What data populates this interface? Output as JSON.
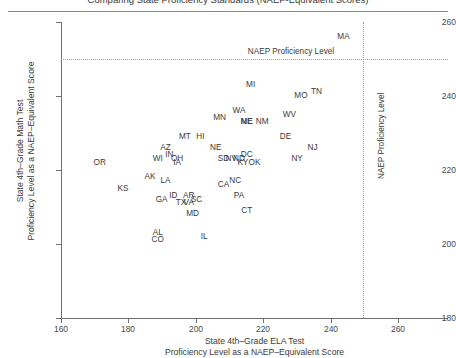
{
  "figure": {
    "title_clipped": "Comparing State Proficiency Standards (NAEP-Equivalent Scores)"
  },
  "chart_data": {
    "type": "scatter",
    "title": "Comparing State Proficiency Standards (NAEP-Equivalent Scores)",
    "xlabel_line1": "State 4th–Grade ELA Test",
    "xlabel_line2": "Proficiency Level as a NAEP–Equivalent Score",
    "ylabel_line1": "State 4th–Grade Math Test",
    "ylabel_line2": "Proficiency Level as a NAEP–Equivalent Score",
    "xlim": [
      160,
      260
    ],
    "ylim": [
      180,
      260
    ],
    "xticks": [
      160,
      180,
      200,
      220,
      240,
      260
    ],
    "yticks": [
      180,
      200,
      220,
      240,
      260
    ],
    "grid": false,
    "legend": null,
    "annotations": [
      {
        "name": "naep-proficiency-horizontal",
        "type": "hline",
        "value": 250,
        "label": "NAEP Proficiency Level",
        "style": "dotted"
      },
      {
        "name": "naep-proficiency-vertical",
        "type": "vline",
        "value": 238,
        "label": "NAEP Proficiency Level",
        "style": "dotted"
      }
    ],
    "point_label_format": "state-abbreviation",
    "points": [
      {
        "label": "MA",
        "x": 233,
        "y": 256
      },
      {
        "label": "MI",
        "x": 209,
        "y": 243
      },
      {
        "label": "TN",
        "x": 226,
        "y": 241
      },
      {
        "label": "MO",
        "x": 222,
        "y": 240
      },
      {
        "label": "WA",
        "x": 206,
        "y": 236
      },
      {
        "label": "WV",
        "x": 219,
        "y": 235
      },
      {
        "label": "MN",
        "x": 201,
        "y": 234
      },
      {
        "label": "ME",
        "x": 208,
        "y": 233
      },
      {
        "label": "NE",
        "x": 208,
        "y": 233
      },
      {
        "label": "NM",
        "x": 212,
        "y": 233
      },
      {
        "label": "HI",
        "x": 196,
        "y": 229
      },
      {
        "label": "MT",
        "x": 192,
        "y": 229
      },
      {
        "label": "DE",
        "x": 218,
        "y": 229
      },
      {
        "label": "NE2",
        "x": 200,
        "y": 226
      },
      {
        "label": "NJ",
        "x": 225,
        "y": 226
      },
      {
        "label": "AZ",
        "x": 187,
        "y": 226
      },
      {
        "label": "DC",
        "x": 208,
        "y": 224
      },
      {
        "label": "NY",
        "x": 221,
        "y": 223
      },
      {
        "label": "IN",
        "x": 188,
        "y": 224
      },
      {
        "label": "OH",
        "x": 190,
        "y": 223
      },
      {
        "label": "WI",
        "x": 185,
        "y": 223
      },
      {
        "label": "IA",
        "x": 190,
        "y": 222
      },
      {
        "label": "SD",
        "x": 202,
        "y": 223
      },
      {
        "label": "NV",
        "x": 204,
        "y": 223
      },
      {
        "label": "ND",
        "x": 206,
        "y": 223
      },
      {
        "label": "KY",
        "x": 207,
        "y": 222
      },
      {
        "label": "OK",
        "x": 210,
        "y": 222
      },
      {
        "label": "OR",
        "x": 170,
        "y": 222
      },
      {
        "label": "AK",
        "x": 183,
        "y": 218
      },
      {
        "label": "LA",
        "x": 187,
        "y": 217
      },
      {
        "label": "NC",
        "x": 205,
        "y": 217
      },
      {
        "label": "CA",
        "x": 202,
        "y": 216
      },
      {
        "label": "KS",
        "x": 176,
        "y": 215
      },
      {
        "label": "AR",
        "x": 193,
        "y": 213
      },
      {
        "label": "SC",
        "x": 195,
        "y": 212
      },
      {
        "label": "GA",
        "x": 186,
        "y": 212
      },
      {
        "label": "ID",
        "x": 189,
        "y": 213
      },
      {
        "label": "TX",
        "x": 191,
        "y": 211
      },
      {
        "label": "VA",
        "x": 193,
        "y": 211
      },
      {
        "label": "PA",
        "x": 206,
        "y": 213
      },
      {
        "label": "CT",
        "x": 208,
        "y": 209
      },
      {
        "label": "MD",
        "x": 194,
        "y": 208
      },
      {
        "label": "AL",
        "x": 185,
        "y": 203
      },
      {
        "label": "CO",
        "x": 185,
        "y": 201
      },
      {
        "label": "IL",
        "x": 197,
        "y": 202
      }
    ]
  }
}
